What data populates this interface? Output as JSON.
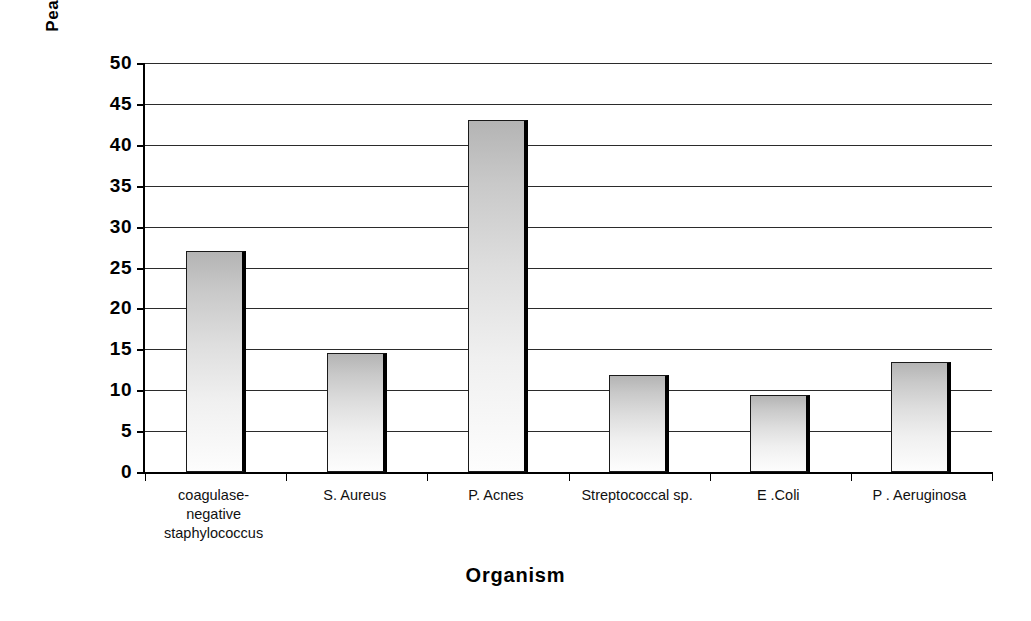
{
  "chart_data": {
    "type": "bar",
    "title": "",
    "xlabel": "Organism",
    "ylabel": "Peak Eosinophil Percentage",
    "categories": [
      "coagulase-\nnegative\nstaphylococcus",
      "S. Aureus",
      "P. Acnes",
      "Streptococcal sp.",
      "E .Coli",
      "P . Aeruginosa"
    ],
    "values": [
      27,
      14.5,
      43,
      11.8,
      9.4,
      13.5
    ],
    "ylim": [
      0,
      50
    ],
    "ytick_labels": [
      "50",
      "45",
      "40",
      "35",
      "30",
      "25",
      "20",
      "15",
      "10",
      "5",
      "0"
    ],
    "ytick_values": [
      50,
      45,
      40,
      35,
      30,
      25,
      20,
      15,
      10,
      5,
      0
    ],
    "grid": true,
    "legend": "none",
    "bar_fill": "#d8d8d8",
    "bar_edge": "#000000",
    "axis_color": "#000000",
    "background": "#ffffff"
  },
  "axes": {
    "y_title": "Peak Eosinophil Percentage",
    "x_title": "Organism"
  }
}
